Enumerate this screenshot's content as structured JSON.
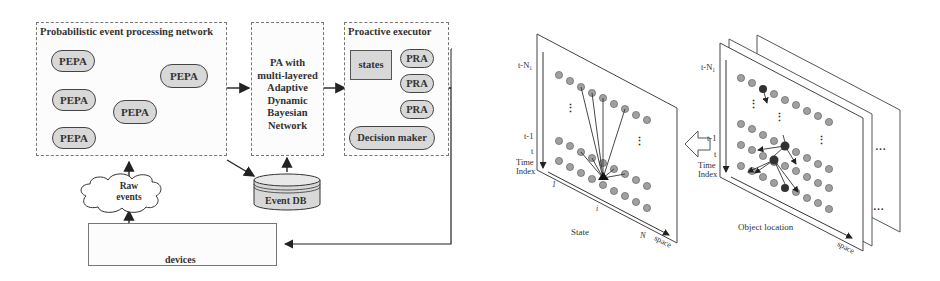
{
  "architecture": {
    "pepn": {
      "title": "Probabilistic event processing network",
      "nodes": [
        "PEPA",
        "PEPA",
        "PEPA",
        "PEPA",
        "PEPA"
      ]
    },
    "pa": {
      "lines": [
        "PA with",
        "multi-layered",
        "Adaptive",
        "Dynamic",
        "Bayesian",
        "Network"
      ]
    },
    "executor": {
      "title": "Proactive executor",
      "states_label": "states",
      "pra": [
        "PRA",
        "PRA",
        "PRA"
      ],
      "decision_maker": "Decision maker"
    },
    "raw_events": {
      "line1": "Raw",
      "line2": "events"
    },
    "event_db": "Event DB",
    "devices": {
      "label": "devices",
      "icons": [
        "traffic-light-icon",
        "sensor-map-icon",
        "rfid-car-icon",
        "display-panel-icon"
      ]
    }
  },
  "left_plane": {
    "time_labels": [
      "t-N₁",
      "t-1",
      "t"
    ],
    "time_axis_label_1": "Time",
    "time_axis_label_2": "Index",
    "x_label": "State",
    "x_ticks": [
      "1",
      "i",
      "N"
    ],
    "space_label": "space",
    "ellipsis": "⋮"
  },
  "arrow_between": "hollow-left-arrow",
  "right_plane": {
    "time_labels": [
      "t-N₁",
      "t-1",
      "t"
    ],
    "time_axis_label_1": "Time",
    "time_axis_label_2": "Index",
    "x_label": "Object location",
    "space_label": "space",
    "more": "…"
  }
}
